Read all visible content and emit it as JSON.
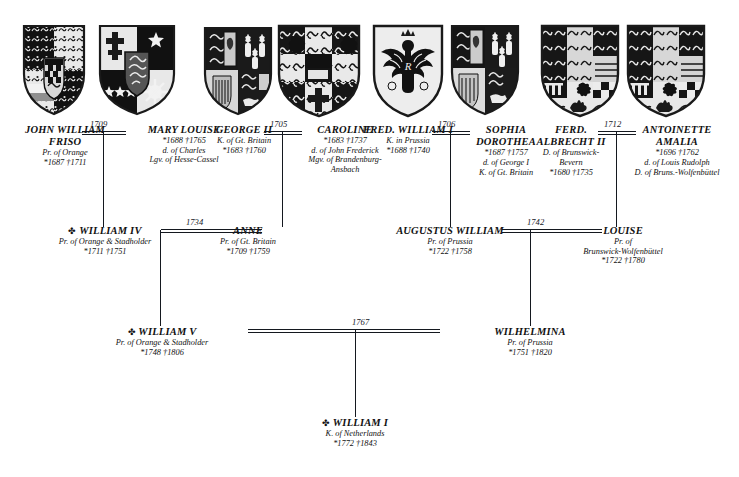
{
  "document": {
    "type": "genealogical-descent-chart",
    "symbols": {
      "birth": "*",
      "death": "†",
      "crown": "✤"
    },
    "accent_color": "#14181f",
    "background_color": "#ffffff"
  },
  "generations": [
    {
      "index": 1,
      "people": [
        {
          "id": "john-william-friso",
          "name": "JOHN WILLIAM\nFRISO",
          "name_line1": "JOHN WILLIAM",
          "name_line2": "FRISO",
          "crown": false,
          "titles": [
            "Pr. of Orange"
          ],
          "dates": "*1687   †1711",
          "birth": "1687",
          "death": "1711",
          "shield": "orange-nassau-quartered"
        },
        {
          "id": "mary-louise",
          "name": "MARY LOUISE",
          "crown": false,
          "titles": [
            "d. of Charles",
            "Lgv. of Hesse-Cassel"
          ],
          "dates": "*1688   †1765",
          "birth": "1688",
          "death": "1765",
          "shield": "hesse-cassel-quartered"
        },
        {
          "id": "george-ii",
          "name": "GEORGE II",
          "crown": false,
          "titles": [
            "K. of Gt. Britain"
          ],
          "dates": "*1683   †1760",
          "birth": "1683",
          "death": "1760",
          "shield": "great-britain-hanover"
        },
        {
          "id": "caroline",
          "name": "CAROLINE",
          "crown": false,
          "titles": [
            "d. of John Frederick",
            "Mgv. of Brandenburg-",
            "Ansbach"
          ],
          "dates": "*1683   †1737",
          "birth": "1683",
          "death": "1737",
          "shield": "brandenburg-ansbach"
        },
        {
          "id": "fred-william-i",
          "name": "FRED. WILLIAM I",
          "crown": false,
          "titles": [
            "K. in Prussia"
          ],
          "dates": "*1688   †1740",
          "birth": "1688",
          "death": "1740",
          "shield": "prussian-eagle"
        },
        {
          "id": "sophia-dorothea",
          "name": "SOPHIA\nDOROTHEA",
          "name_line1": "SOPHIA",
          "name_line2": "DOROTHEA",
          "crown": false,
          "titles": [
            "d. of George I",
            "K. of Gt. Britain"
          ],
          "dates": "*1687   †1757",
          "birth": "1687",
          "death": "1757",
          "shield": "great-britain-hanover-2"
        },
        {
          "id": "ferd-albrecht-ii",
          "name": "FERD.\nALBRECHT II",
          "name_line1": "FERD.",
          "name_line2": "ALBRECHT II",
          "crown": false,
          "titles": [
            "D. of Brunswick-",
            "Bevern"
          ],
          "dates": "*1680   †1735",
          "birth": "1680",
          "death": "1735",
          "shield": "brunswick-luneburg"
        },
        {
          "id": "antoinette-amalia",
          "name": "ANTOINETTE\nAMALIA",
          "name_line1": "ANTOINETTE",
          "name_line2": "AMALIA",
          "crown": false,
          "titles": [
            "d. of Louis Rudolph",
            "D. of Bruns.-Wolfenbüttel"
          ],
          "dates": "*1696   †1762",
          "birth": "1696",
          "death": "1762",
          "shield": "brunswick-luneburg-2"
        }
      ]
    },
    {
      "index": 2,
      "people": [
        {
          "id": "william-iv",
          "name": "WILLIAM IV",
          "crown": true,
          "titles": [
            "Pr. of Orange & Stadholder"
          ],
          "dates": "*1711   †1751",
          "birth": "1711",
          "death": "1751"
        },
        {
          "id": "anne",
          "name": "ANNE",
          "crown": false,
          "titles": [
            "Pr. of Gt. Britain"
          ],
          "dates": "*1709   †1759",
          "birth": "1709",
          "death": "1759"
        },
        {
          "id": "augustus-william",
          "name": "AUGUSTUS WILLIAM",
          "crown": false,
          "titles": [
            "Pr. of Prussia"
          ],
          "dates": "*1722   †1758",
          "birth": "1722",
          "death": "1758"
        },
        {
          "id": "louise",
          "name": "LOUISE",
          "crown": false,
          "titles": [
            "Pr. of",
            "Brunswick-Wolfenbüttel"
          ],
          "dates": "*1722   †1780",
          "birth": "1722",
          "death": "1780"
        }
      ]
    },
    {
      "index": 3,
      "people": [
        {
          "id": "william-v",
          "name": "WILLIAM V",
          "crown": true,
          "titles": [
            "Pr. of Orange & Stadholder"
          ],
          "dates": "*1748   †1806",
          "birth": "1748",
          "death": "1806"
        },
        {
          "id": "wilhelmina",
          "name": "WILHELMINA",
          "crown": false,
          "titles": [
            "Pr. of Prussia"
          ],
          "dates": "*1751   †1820",
          "birth": "1751",
          "death": "1820"
        }
      ]
    },
    {
      "index": 4,
      "people": [
        {
          "id": "william-i",
          "name": "WILLIAM I",
          "crown": true,
          "titles": [
            "K. of Netherlands"
          ],
          "dates": "*1772   †1843",
          "birth": "1772",
          "death": "1843"
        }
      ]
    }
  ],
  "marriages": [
    {
      "id": "m-1709",
      "year": "1709",
      "spouses": [
        "JOHN WILLIAM FRISO",
        "MARY LOUISE"
      ]
    },
    {
      "id": "m-1705",
      "year": "1705",
      "spouses": [
        "GEORGE II",
        "CAROLINE"
      ]
    },
    {
      "id": "m-1706",
      "year": "1706",
      "spouses": [
        "FRED. WILLIAM I",
        "SOPHIA DOROTHEA"
      ]
    },
    {
      "id": "m-1712",
      "year": "1712",
      "spouses": [
        "FERD. ALBRECHT II",
        "ANTOINETTE AMALIA"
      ]
    },
    {
      "id": "m-1734",
      "year": "1734",
      "spouses": [
        "WILLIAM IV",
        "ANNE"
      ]
    },
    {
      "id": "m-1742",
      "year": "1742",
      "spouses": [
        "AUGUSTUS WILLIAM",
        "LOUISE"
      ]
    },
    {
      "id": "m-1767",
      "year": "1767",
      "spouses": [
        "WILLIAM V",
        "WILHELMINA"
      ]
    }
  ]
}
